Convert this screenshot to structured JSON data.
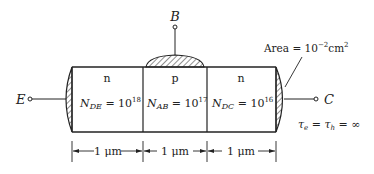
{
  "diagram": {
    "type": "bipolar-transistor-structure",
    "terminals": {
      "emitter": "E",
      "base": "B",
      "collector": "C"
    },
    "regions": [
      {
        "type": "n",
        "doping_symbol": "N",
        "doping_sub": "DE",
        "doping_eq": " = 10",
        "doping_exp": "18"
      },
      {
        "type": "p",
        "doping_symbol": "N",
        "doping_sub": "AB",
        "doping_eq": " = 10",
        "doping_exp": "17"
      },
      {
        "type": "n",
        "doping_symbol": "N",
        "doping_sub": "DC",
        "doping_eq": " = 10",
        "doping_exp": "16"
      }
    ],
    "dimensions": [
      "1 μm",
      "1 μm",
      "1 μm"
    ],
    "area": {
      "prefix": "Area = 10",
      "exp": "−2",
      "unit": "cm",
      "unit_exp": "2"
    },
    "lifetime": {
      "tau_e": "τ",
      "sub_e": "e",
      "eq": " = ",
      "tau_h": "τ",
      "sub_h": "h",
      "value": " = ∞"
    },
    "colors": {
      "line": "#222222",
      "background": "#ffffff"
    }
  }
}
